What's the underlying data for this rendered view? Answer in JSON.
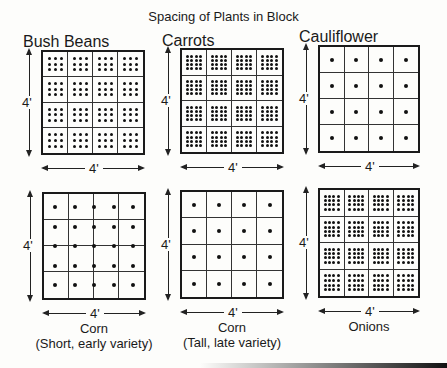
{
  "title": "Spacing of Plants in Block",
  "dimension_label": "4'",
  "blocks": [
    {
      "name": "Bush Beans",
      "sub": "",
      "label_position": "top",
      "plants_per_sqft": 9,
      "pattern": "3x3 per cell",
      "grid": [
        3,
        3
      ]
    },
    {
      "name": "Carrots",
      "sub": "",
      "label_position": "top",
      "plants_per_sqft": 16,
      "pattern": "4x4 per cell",
      "grid": [
        4,
        4
      ]
    },
    {
      "name": "Cauliflower",
      "sub": "",
      "label_position": "top",
      "plants_per_sqft": 1,
      "pattern": "1 per cell",
      "grid": [
        1,
        1
      ]
    },
    {
      "name": "Corn",
      "sub": "(Short, early variety)",
      "label_position": "bottom",
      "plants_per_block": 25,
      "pattern": "5x5 across block",
      "grid": [
        0,
        0
      ]
    },
    {
      "name": "Corn",
      "sub": "(Tall, late variety)",
      "label_position": "bottom",
      "plants_per_sqft": 1,
      "pattern": "1 per cell",
      "grid": [
        1,
        1
      ]
    },
    {
      "name": "Onions",
      "sub": "",
      "label_position": "bottom",
      "plants_per_sqft": 16,
      "pattern": "4x4 per cell",
      "grid": [
        4,
        4
      ]
    }
  ]
}
